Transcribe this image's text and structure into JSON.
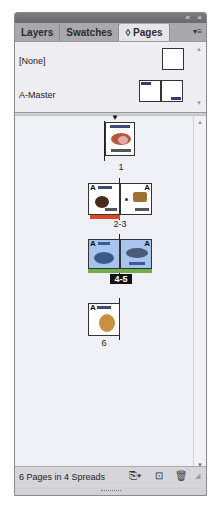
{
  "titlebar": {
    "collapse_icon": "«",
    "close_icon": "×"
  },
  "tabs": [
    {
      "label": "Layers",
      "active": false
    },
    {
      "label": "Swatches",
      "active": false
    },
    {
      "label": "◊ Pages",
      "active": true
    }
  ],
  "panel_menu_icon": "▾≡",
  "masters": [
    {
      "label": "[None]"
    },
    {
      "label": "A-Master"
    }
  ],
  "spreads": [
    {
      "label": "1",
      "selected": false,
      "target": true
    },
    {
      "label": "2-3",
      "selected": false,
      "color_label": "#d9482a"
    },
    {
      "label": "4-5",
      "selected": true,
      "color_label": "#6fae4a"
    },
    {
      "label": "6",
      "selected": false
    }
  ],
  "footer": {
    "status": "6 Pages in 4 Spreads",
    "edit_page_size_icon": "page-size-icon",
    "new_page_icon": "new-page-icon",
    "delete_icon": "trash-icon"
  },
  "colors": {
    "selected_page": "#a8c4ec",
    "spread2_label": "#d9482a",
    "spread3_label": "#6fae4a"
  }
}
